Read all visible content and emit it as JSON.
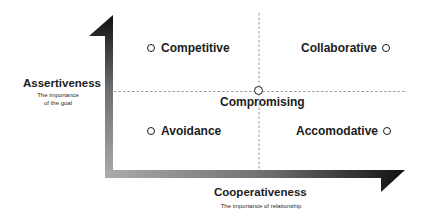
{
  "diagram": {
    "y_axis": {
      "label": "Assertiveness",
      "sublabel_line1": "The importance",
      "sublabel_line2": "of the goal"
    },
    "x_axis": {
      "label": "Cooperativeness",
      "sublabel": "The importance of relationship"
    },
    "quadrants": {
      "top_left": "Competitive",
      "top_right": "Collaborative",
      "bottom_left": "Avoidance",
      "bottom_right": "Accomodative"
    },
    "center": "Compromising",
    "colors": {
      "arrow_dark": "#1a1a1a",
      "arrow_light": "#a8a8a8",
      "dash": "#9a9a9a",
      "text": "#1c1c1c"
    }
  }
}
